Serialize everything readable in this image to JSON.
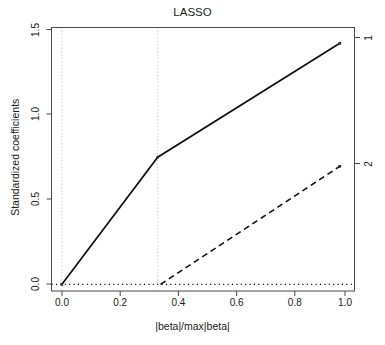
{
  "chart_data": {
    "type": "line",
    "title": "LASSO",
    "xlabel": "|beta|/max|beta|",
    "ylabel": "Standardized coefficients",
    "xlim": [
      -0.037,
      1.053
    ],
    "ylim": [
      -0.04,
      1.545
    ],
    "grid": false,
    "legend": "right-axis-variable-numbers",
    "xticks": [
      {
        "value": 0.0,
        "label": "0.0"
      },
      {
        "value": 0.2,
        "label": "0.2"
      },
      {
        "value": 0.4,
        "label": "0.4"
      },
      {
        "value": 0.6,
        "label": "0.6"
      },
      {
        "value": 0.8,
        "label": "0.8"
      },
      {
        "value": 1.0,
        "label": "1.0"
      }
    ],
    "yticks": [
      {
        "value": 0.0,
        "label": "0.0"
      },
      {
        "value": 0.5,
        "label": "0.5"
      },
      {
        "value": 1.0,
        "label": "1.0"
      },
      {
        "value": 1.5,
        "label": "1.5"
      }
    ],
    "right_axis_ticks": [
      {
        "value": 1.45,
        "label": "1"
      },
      {
        "value": 0.71,
        "label": "2"
      }
    ],
    "series": [
      {
        "name": "1",
        "style": "solid",
        "color": "#000000",
        "points": [
          {
            "x": 0.0,
            "y": 0.0
          },
          {
            "x": 0.345,
            "y": 0.765
          },
          {
            "x": 1.0,
            "y": 1.45
          }
        ],
        "markers": [
          {
            "x": 0.0,
            "y": 0.0
          },
          {
            "x": 0.345,
            "y": 0.765
          },
          {
            "x": 1.0,
            "y": 1.45
          }
        ]
      },
      {
        "name": "2",
        "style": "dashed",
        "color": "#000000",
        "points": [
          {
            "x": 0.0,
            "y": 0.0
          },
          {
            "x": 0.355,
            "y": 0.0
          },
          {
            "x": 1.0,
            "y": 0.71
          }
        ],
        "markers": [
          {
            "x": 1.0,
            "y": 0.71
          }
        ]
      },
      {
        "name": "zero-reference",
        "style": "dotted",
        "color": "#000000",
        "points": [
          {
            "x": -0.037,
            "y": 0.0
          },
          {
            "x": 1.053,
            "y": 0.0
          }
        ],
        "markers": []
      }
    ],
    "vertical_step_lines": [
      {
        "x": 0.0
      },
      {
        "x": 0.345
      }
    ]
  },
  "axes": {
    "title_text": "LASSO",
    "x_axis_title": "|beta|/max|beta|",
    "y_axis_title": "Standardized coefficients",
    "right_labels": [
      "1",
      "2"
    ]
  }
}
